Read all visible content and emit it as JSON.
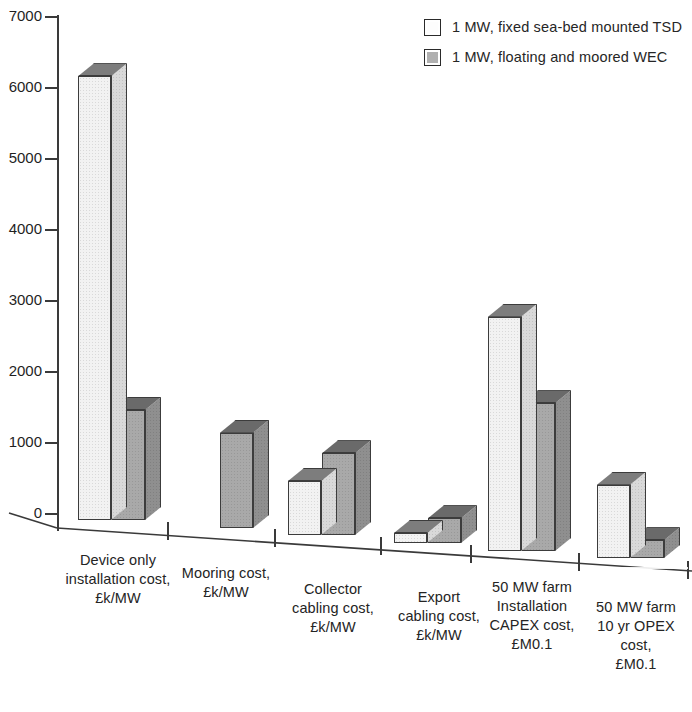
{
  "chart_data": {
    "type": "bar",
    "title": "",
    "xlabel": "",
    "ylabel": "",
    "ylim": [
      0,
      7000
    ],
    "ytick_step": 1000,
    "yticks": [
      "7000",
      "6000",
      "5000",
      "4000",
      "3000",
      "2000",
      "1000",
      "0"
    ],
    "grid": false,
    "legend_position": "top-right",
    "style": "3d-isometric-bars",
    "categories": [
      "Device only installation cost, £k/MW",
      "Mooring cost, £k/MW",
      "Collector cabling cost, £k/MW",
      "Export cabling cost, £k/MW",
      "50 MW farm Installation CAPEX cost, £M0.1",
      "50 MW farm 10 yr OPEX cost, £M0.1"
    ],
    "category_lines": [
      [
        "Device only",
        "installation cost,",
        "£k/MW"
      ],
      [
        "Mooring cost,",
        "£k/MW"
      ],
      [
        "Collector",
        "cabling cost,",
        "£k/MW"
      ],
      [
        "Export",
        "cabling cost,",
        "£k/MW"
      ],
      [
        "50 MW farm",
        "Installation",
        "CAPEX cost,",
        "£M0.1"
      ],
      [
        "50 MW farm",
        "10 yr OPEX",
        "cost,",
        "£M0.1"
      ]
    ],
    "series": [
      {
        "name": "1 MW, fixed sea-bed mounted TSD",
        "color": "#f2f2f2",
        "values": [
          6250,
          0,
          760,
          140,
          3300,
          1030
        ]
      },
      {
        "name": "1 MW, floating and moored WEC",
        "color": "#a9a9a9",
        "values": [
          1550,
          1340,
          1150,
          350,
          2080,
          250
        ]
      }
    ]
  },
  "legend": {
    "items": [
      {
        "label": "1 MW, fixed sea-bed mounted TSD",
        "swatch": "white"
      },
      {
        "label": "1 MW, floating and moored WEC",
        "swatch": "grey"
      }
    ]
  },
  "axis": {
    "y_ticks": [
      "7000",
      "6000",
      "5000",
      "4000",
      "3000",
      "2000",
      "1000",
      "0"
    ]
  }
}
